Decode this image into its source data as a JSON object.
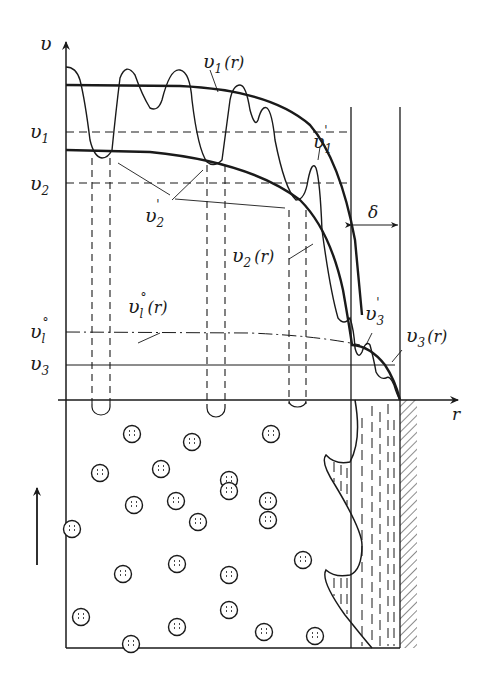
{
  "diagram": {
    "axes": {
      "y_label": "υ",
      "x_label": "r"
    },
    "levels": [
      {
        "id": "v1",
        "label": "υ",
        "sub": "1",
        "style": "dashed"
      },
      {
        "id": "v2",
        "label": "υ",
        "sub": "2",
        "style": "dashed"
      },
      {
        "id": "vl0",
        "label": "υ",
        "sub": "l",
        "sup": "°",
        "style": "dash-dot"
      },
      {
        "id": "v3",
        "label": "υ",
        "sub": "3",
        "style": "solid"
      }
    ],
    "curve_labels": {
      "v1r": {
        "main": "υ",
        "sub": "1",
        "arg": "(r)"
      },
      "v2r": {
        "main": "υ",
        "sub": "2",
        "arg": "(r)"
      },
      "v3r": {
        "main": "υ",
        "sub": "3",
        "arg": "(r)"
      },
      "vl0r": {
        "main": "υ",
        "sub": "l",
        "sup": "°",
        "arg": "(r)"
      },
      "v1p": {
        "main": "υ",
        "sub": "1",
        "prime": "'"
      },
      "v2p": {
        "main": "υ",
        "sub": "2",
        "prime": "'"
      },
      "v3p": {
        "main": "υ",
        "sub": "3",
        "prime": "'"
      }
    },
    "boundary_layer_label": "δ",
    "flow_direction": "up",
    "colors": {
      "ink": "#1a1a1a",
      "background": "#ffffff"
    }
  }
}
